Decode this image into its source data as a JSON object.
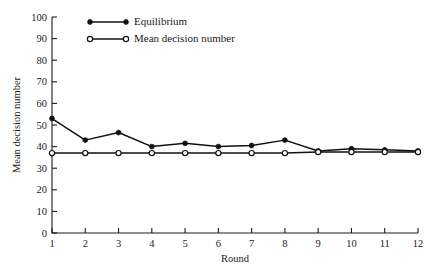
{
  "chart_data": {
    "type": "line",
    "title": "",
    "xlabel": "Round",
    "ylabel": "Mean decision number",
    "x": [
      1,
      2,
      3,
      4,
      5,
      6,
      7,
      8,
      9,
      10,
      11,
      12
    ],
    "xticklabels": [
      "1",
      "2",
      "3",
      "4",
      "5",
      "6",
      "7",
      "8",
      "9",
      "10",
      "11",
      "12"
    ],
    "yticklabels": [
      "0",
      "10",
      "20",
      "30",
      "40",
      "50",
      "60",
      "70",
      "80",
      "90",
      "100"
    ],
    "yticks": [
      0,
      10,
      20,
      30,
      40,
      50,
      60,
      70,
      80,
      90,
      100
    ],
    "xlim": [
      1,
      12
    ],
    "ylim": [
      0,
      100
    ],
    "grid": false,
    "legend_position": "top-left-inside",
    "series": [
      {
        "name": "Equilibrium",
        "marker": "filled-circle",
        "values": [
          53,
          43,
          46.5,
          40,
          41.5,
          40,
          40.5,
          43,
          38,
          39,
          38.5,
          38
        ]
      },
      {
        "name": "Mean decision number",
        "marker": "open-circle",
        "values": [
          37,
          37,
          37,
          37,
          37,
          37,
          37,
          37,
          37.5,
          37.5,
          37.5,
          37.5
        ]
      }
    ],
    "colors": {
      "line": "#111111",
      "axis": "#1a1a1a",
      "background": "#ffffff"
    }
  }
}
